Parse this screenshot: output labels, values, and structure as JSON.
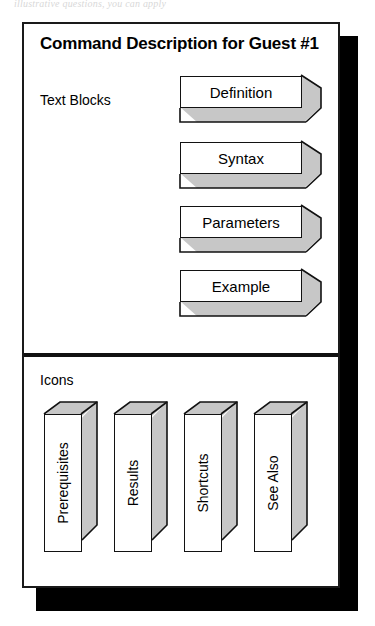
{
  "scan": {
    "top_fragment": "illustrative questions, you can apply"
  },
  "figure": {
    "title": "Command Description for Guest #1",
    "colors": {
      "outline": "#121212",
      "extrusion_gray": "#c7c7c7",
      "shadow": "#000000",
      "background": "#ffffff"
    },
    "sections": [
      {
        "label": "Text Blocks",
        "orientation": "horizontal",
        "blocks": [
          {
            "label": "Definition"
          },
          {
            "label": "Syntax"
          },
          {
            "label": "Parameters"
          },
          {
            "label": "Example"
          }
        ]
      },
      {
        "label": "Icons",
        "orientation": "vertical",
        "blocks": [
          {
            "label": "Prerequisites"
          },
          {
            "label": "Results"
          },
          {
            "label": "Shortcuts"
          },
          {
            "label": "See Also"
          }
        ]
      }
    ]
  }
}
